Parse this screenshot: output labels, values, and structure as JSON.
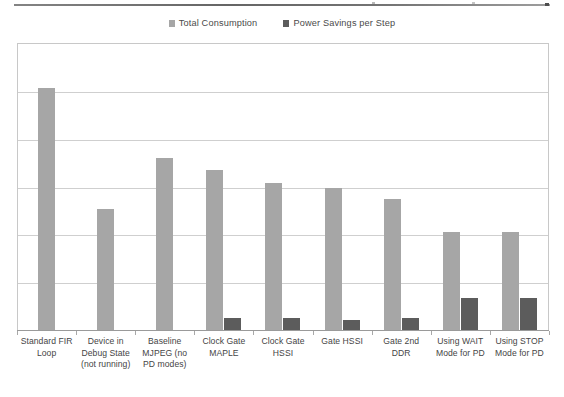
{
  "chart_data": {
    "type": "bar",
    "title": "",
    "subtitle": "",
    "xlabel": "",
    "ylabel": "",
    "categories": [
      "Standard FIR Loop",
      "Device in Debug State (not running)",
      "Baseline MJPEG (no PD modes)",
      "Clock Gate MAPLE",
      "Clock Gate HSSI",
      "Gate HSSI",
      "Gate 2nd DDR",
      "Using WAIT Mode for PD",
      "Using STOP Mode for PD"
    ],
    "category_lines": [
      [
        "Standard FIR",
        "Loop"
      ],
      [
        "Device in",
        "Debug State",
        "(not running)"
      ],
      [
        "Baseline",
        "MJPEG (no",
        "PD modes)"
      ],
      [
        "Clock Gate",
        "MAPLE"
      ],
      [
        "Clock Gate",
        "HSSI"
      ],
      [
        "Gate HSSI"
      ],
      [
        "Gate 2nd",
        "DDR"
      ],
      [
        "Using WAIT",
        "Mode for PD"
      ],
      [
        "Using STOP",
        "Mode for PD"
      ]
    ],
    "series": [
      {
        "name": "Total Consumption",
        "color": "#a6a6a6",
        "values": [
          5.06,
          2.53,
          3.6,
          3.35,
          3.07,
          2.97,
          2.74,
          2.05,
          2.05
        ]
      },
      {
        "name": "Power Savings per Step",
        "color": "#5c5c5c",
        "values": [
          0,
          0,
          0,
          0.25,
          0.25,
          0.2,
          0.26,
          0.67,
          0.67
        ]
      }
    ],
    "ylim": [
      0,
      6
    ],
    "ytick_count": 7,
    "ytick_labels_visible": false,
    "grid": true,
    "legend_position": "top-center"
  },
  "legend": {
    "entries": [
      {
        "label": "Total Consumption",
        "color": "#a6a6a6"
      },
      {
        "label": "Power Savings per Step",
        "color": "#5c5c5c"
      }
    ]
  }
}
